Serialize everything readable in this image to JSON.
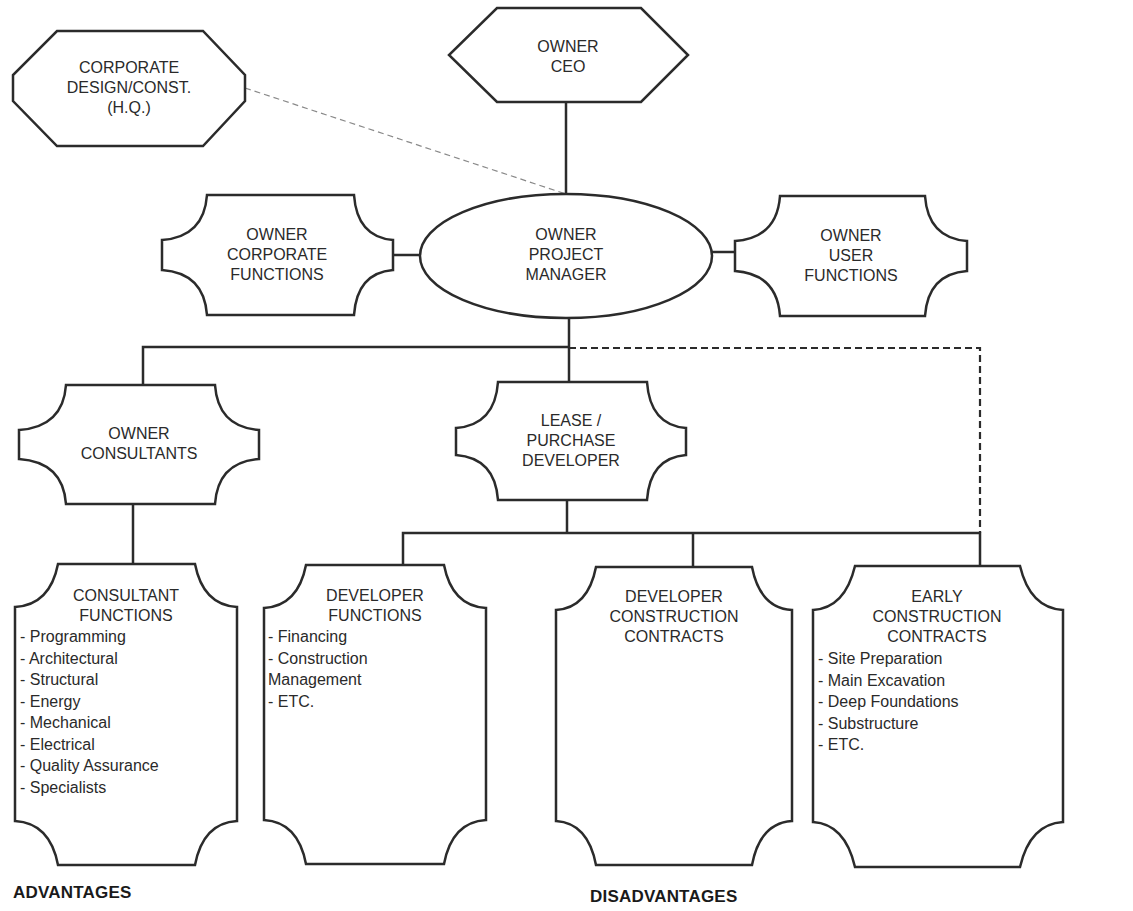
{
  "diagram": {
    "nodes": {
      "corporate_design": {
        "lines": [
          "CORPORATE",
          "DESIGN/CONST.",
          "(H.Q.)"
        ]
      },
      "owner_ceo": {
        "lines": [
          "OWNER",
          "CEO"
        ]
      },
      "owner_corporate_functions": {
        "lines": [
          "OWNER",
          "CORPORATE",
          "FUNCTIONS"
        ]
      },
      "owner_project_manager": {
        "lines": [
          "OWNER",
          "PROJECT",
          "MANAGER"
        ]
      },
      "owner_user_functions": {
        "lines": [
          "OWNER",
          "USER",
          "FUNCTIONS"
        ]
      },
      "owner_consultants": {
        "lines": [
          "OWNER",
          "CONSULTANTS"
        ]
      },
      "lease_purchase_developer": {
        "lines": [
          "LEASE /",
          "PURCHASE",
          "DEVELOPER"
        ]
      },
      "consultant_functions": {
        "lines": [
          "CONSULTANT",
          "FUNCTIONS"
        ],
        "items": [
          "- Programming",
          "- Architectural",
          "- Structural",
          "- Energy",
          "- Mechanical",
          "- Electrical",
          "- Quality Assurance",
          "- Specialists"
        ]
      },
      "developer_functions": {
        "lines": [
          "DEVELOPER",
          "FUNCTIONS"
        ],
        "items": [
          "- Financing",
          "- Construction",
          "Management",
          "- ETC."
        ]
      },
      "developer_construction_contracts": {
        "lines": [
          "DEVELOPER",
          "CONSTRUCTION",
          "CONTRACTS"
        ]
      },
      "early_construction_contracts": {
        "lines": [
          "EARLY",
          "CONSTRUCTION",
          "CONTRACTS"
        ],
        "items": [
          "- Site Preparation",
          "- Main Excavation",
          "- Deep Foundations",
          "- Substructure",
          "- ETC."
        ]
      }
    },
    "edges": [
      {
        "from": "owner_ceo",
        "to": "owner_project_manager",
        "style": "solid"
      },
      {
        "from": "corporate_design",
        "to": "owner_project_manager",
        "style": "dashed-thin"
      },
      {
        "from": "owner_corporate_functions",
        "to": "owner_project_manager",
        "style": "solid"
      },
      {
        "from": "owner_user_functions",
        "to": "owner_project_manager",
        "style": "solid"
      },
      {
        "from": "owner_project_manager",
        "to": "owner_consultants",
        "style": "solid"
      },
      {
        "from": "owner_project_manager",
        "to": "lease_purchase_developer",
        "style": "solid"
      },
      {
        "from": "owner_project_manager",
        "to": "early_construction_contracts",
        "style": "dashed"
      },
      {
        "from": "owner_consultants",
        "to": "consultant_functions",
        "style": "solid"
      },
      {
        "from": "lease_purchase_developer",
        "to": "developer_functions",
        "style": "solid"
      },
      {
        "from": "lease_purchase_developer",
        "to": "developer_construction_contracts",
        "style": "solid"
      },
      {
        "from": "lease_purchase_developer",
        "to": "early_construction_contracts",
        "style": "solid"
      }
    ],
    "colors": {
      "stroke": "#2b2b2b",
      "text": "#2a2a2a",
      "background": "#ffffff"
    }
  },
  "footer": {
    "advantages": "ADVANTAGES",
    "disadvantages": "DISADVANTAGES"
  }
}
